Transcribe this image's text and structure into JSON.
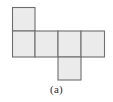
{
  "figure": {
    "caption": "(a)",
    "kind": "cube-net",
    "colors": {
      "cell_fill": "#ebebeb",
      "cell_stroke": "#6e6e6e",
      "background": "#ffffff",
      "caption_color": "#2b2b2b"
    },
    "grid": {
      "cell_size": 23.5,
      "origin_x": 12,
      "origin_y": 7,
      "columns": 4,
      "rows": 3,
      "x_lines": [
        12,
        35,
        58,
        81,
        105
      ],
      "y_lines": [
        7,
        31,
        57,
        80
      ]
    },
    "cells": [
      {
        "id": "cell-top-col0",
        "label": "top square",
        "col": 0,
        "row": 0,
        "x": 12,
        "y": 7,
        "w": 23,
        "h": 24
      },
      {
        "id": "cell-mid-col0",
        "label": "middle square left",
        "col": 0,
        "row": 1,
        "x": 12,
        "y": 31,
        "w": 23,
        "h": 26
      },
      {
        "id": "cell-mid-col1",
        "label": "middle square second",
        "col": 1,
        "row": 1,
        "x": 35,
        "y": 31,
        "w": 23,
        "h": 26
      },
      {
        "id": "cell-mid-col2",
        "label": "middle square third",
        "col": 2,
        "row": 1,
        "x": 58,
        "y": 31,
        "w": 23,
        "h": 26
      },
      {
        "id": "cell-mid-col3",
        "label": "middle square right",
        "col": 3,
        "row": 1,
        "x": 81,
        "y": 31,
        "w": 24,
        "h": 26
      },
      {
        "id": "cell-bottom-col2",
        "label": "bottom square",
        "col": 2,
        "row": 2,
        "x": 58,
        "y": 57,
        "w": 23,
        "h": 23
      }
    ],
    "cell_count": 6
  }
}
